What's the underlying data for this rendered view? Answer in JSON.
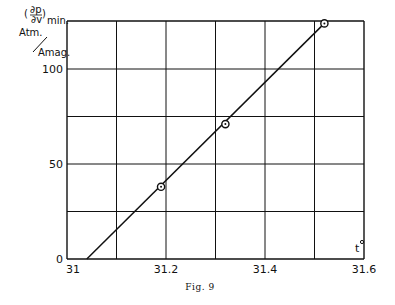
{
  "chart_data": {
    "type": "line",
    "title": "",
    "caption": "Fig. 9",
    "xlabel": "t°",
    "ylabel": "(∂p/∂v)min, Atm/Amag.",
    "ylabel_parts": {
      "numerator": "∂p",
      "denominator": "∂v",
      "subscript": "min.",
      "unit_top": "Atm.",
      "unit_bottom": "Amag."
    },
    "xlim": [
      31,
      31.6
    ],
    "ylim": [
      0,
      125
    ],
    "x_ticks": [
      "31",
      "31.2",
      "31.4",
      "31.6"
    ],
    "y_ticks": [
      "0",
      "50",
      "100"
    ],
    "grid": true,
    "grid_x_step": 0.1,
    "grid_y_step": 25,
    "series": [
      {
        "name": "measured",
        "marker": "circle-dot",
        "points": [
          {
            "x": 31.19,
            "y": 38
          },
          {
            "x": 31.32,
            "y": 71
          },
          {
            "x": 31.52,
            "y": 124
          }
        ]
      },
      {
        "name": "fit line",
        "marker": "none",
        "points": [
          {
            "x": 31.04,
            "y": 0
          },
          {
            "x": 31.52,
            "y": 124
          }
        ]
      }
    ]
  }
}
